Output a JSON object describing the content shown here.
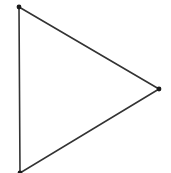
{
  "diagram": {
    "type": "triangle",
    "stroke_color": "#333333",
    "vertex_color": "#1a1a1a",
    "vertices": [
      {
        "id": "top-left",
        "x": 19,
        "y": 7
      },
      {
        "id": "right",
        "x": 159,
        "y": 89
      },
      {
        "id": "bottom-left",
        "x": 20,
        "y": 173
      }
    ]
  }
}
